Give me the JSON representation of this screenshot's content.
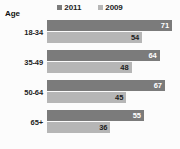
{
  "chart_data": {
    "type": "bar",
    "orientation": "horizontal",
    "title": "",
    "xlabel": "",
    "ylabel": "Age",
    "categories": [
      "18-34",
      "35-49",
      "50-64",
      "65+"
    ],
    "series": [
      {
        "name": "2011",
        "values": [
          71,
          64,
          67,
          55
        ],
        "color": "#7b7b7b"
      },
      {
        "name": "2009",
        "values": [
          54,
          48,
          45,
          36
        ],
        "color": "#b6b6b6"
      }
    ],
    "xlim": [
      0,
      71
    ],
    "grid": false,
    "legend_position": "top-center",
    "value_labels": true
  },
  "legend": {
    "items": [
      {
        "label": "2011",
        "swatch": "legend-swatch-2011"
      },
      {
        "label": "2009",
        "swatch": "legend-swatch-2009"
      }
    ]
  },
  "axis": {
    "title": "Age"
  },
  "style": {
    "background": "#fcfcfc",
    "series_0_color": "#7b7b7b",
    "series_1_color": "#b6b6b6",
    "label_color_dark": "#1c1c1c",
    "label_color_light": "#ffffff"
  }
}
